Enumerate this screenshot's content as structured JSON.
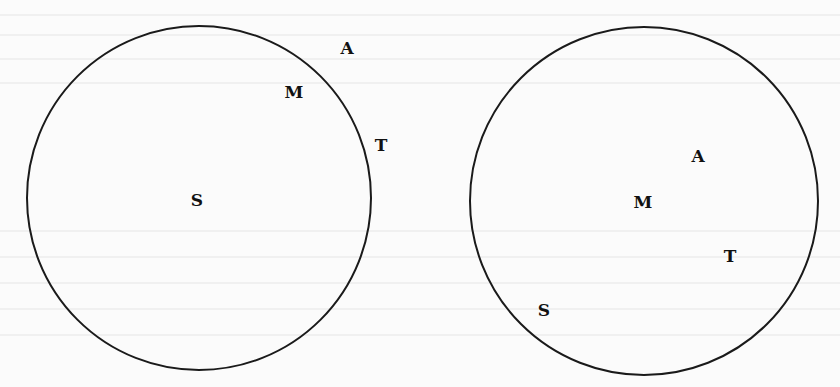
{
  "diagram": {
    "stroke_color": "#1a1a1a",
    "background": "#fbfbfb",
    "panels": [
      {
        "name": "left",
        "circle": {
          "cx": 199,
          "cy": 198,
          "r": 172
        },
        "labels": [
          {
            "text": "A",
            "x": 347,
            "y": 54
          },
          {
            "text": "M",
            "x": 294,
            "y": 98
          },
          {
            "text": "T",
            "x": 381,
            "y": 151
          },
          {
            "text": "S",
            "x": 197,
            "y": 206
          }
        ]
      },
      {
        "name": "right",
        "circle": {
          "cx": 644,
          "cy": 201,
          "r": 174
        },
        "labels": [
          {
            "text": "A",
            "x": 698,
            "y": 162
          },
          {
            "text": "M",
            "x": 643,
            "y": 208
          },
          {
            "text": "T",
            "x": 730,
            "y": 262
          },
          {
            "text": "S",
            "x": 544,
            "y": 316
          }
        ]
      }
    ]
  }
}
